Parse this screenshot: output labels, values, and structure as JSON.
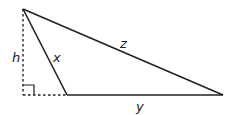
{
  "diagram": {
    "type": "triangle-with-height",
    "colors": {
      "stroke": "#222222",
      "background": "#ffffff"
    },
    "vertices": {
      "apex": [
        23,
        9
      ],
      "base_left": [
        67,
        95
      ],
      "base_right": [
        223,
        95
      ],
      "foot": [
        23,
        95
      ]
    },
    "labels": {
      "h": "h",
      "x": "x",
      "z": "z",
      "y": "y"
    },
    "label_positions": {
      "h": [
        12,
        62
      ],
      "x": [
        53,
        62
      ],
      "z": [
        120,
        48
      ],
      "y": [
        136,
        110
      ]
    }
  }
}
